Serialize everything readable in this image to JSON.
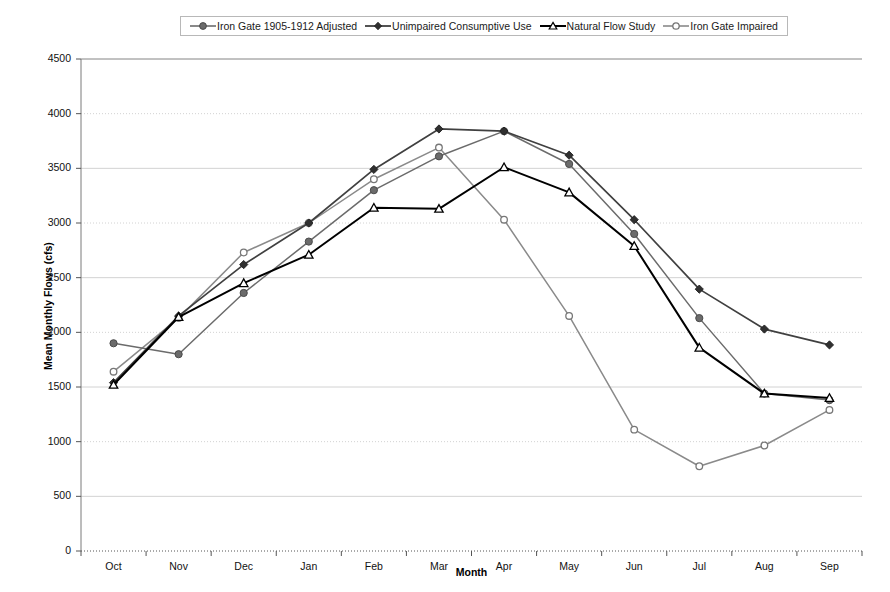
{
  "chart_data": {
    "type": "line",
    "title": "",
    "xlabel": "Month",
    "ylabel": "Mean Monthly Flows (cfs)",
    "categories": [
      "Oct",
      "Nov",
      "Dec",
      "Jan",
      "Feb",
      "Mar",
      "Apr",
      "May",
      "Jun",
      "Jul",
      "Aug",
      "Sep"
    ],
    "ylim": [
      0,
      4500
    ],
    "ytick_step": 500,
    "yticks": [
      4500,
      4000,
      3500,
      3000,
      2500,
      2000,
      1500,
      1000,
      500,
      0
    ],
    "grid": "horizontal",
    "legend_position": "top-center",
    "series": [
      {
        "name": "Iron Gate 1905-1912 Adjusted",
        "marker": "circle-filled",
        "color": "#6b6b6b",
        "values": [
          1900,
          1800,
          2360,
          2830,
          3300,
          3610,
          3840,
          3540,
          2900,
          2130,
          1440,
          1380
        ]
      },
      {
        "name": "Unimpaired Consumptive Use",
        "marker": "diamond-filled",
        "color": "#404040",
        "values": [
          1540,
          2150,
          2620,
          3000,
          3490,
          3860,
          3840,
          3620,
          3030,
          2395,
          2030,
          1885
        ]
      },
      {
        "name": "Natural Flow Study",
        "marker": "triangle-open",
        "color": "#000000",
        "values": [
          1520,
          2140,
          2450,
          2710,
          3140,
          3130,
          3510,
          3280,
          2790,
          1860,
          1440,
          1400
        ]
      },
      {
        "name": "Iron Gate Impaired",
        "marker": "circle-open",
        "color": "#8a8a8a",
        "values": [
          1640,
          2130,
          2730,
          3000,
          3400,
          3690,
          3030,
          2150,
          1110,
          775,
          965,
          1290
        ]
      }
    ]
  },
  "legend": {
    "items": [
      {
        "label": "Iron Gate 1905-1912 Adjusted"
      },
      {
        "label": "Unimpaired Consumptive Use"
      },
      {
        "label": "Natural Flow Study"
      },
      {
        "label": "Iron Gate Impaired"
      }
    ]
  }
}
